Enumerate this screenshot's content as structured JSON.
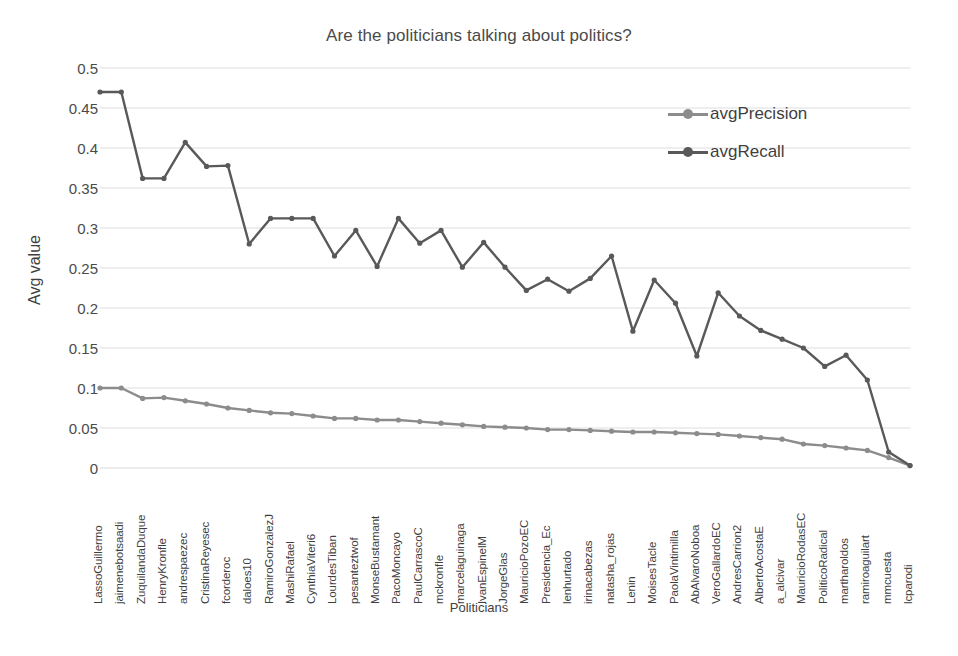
{
  "chart_data": {
    "type": "line",
    "title": "Are the politicians talking about politics?",
    "xlabel": "Politicians",
    "ylabel": "Avg value",
    "ylim": [
      0,
      0.5
    ],
    "yticks": [
      "0",
      "0.05",
      "0.1",
      "0.15",
      "0.2",
      "0.25",
      "0.3",
      "0.35",
      "0.4",
      "0.45",
      "0.5"
    ],
    "grid": true,
    "legend_position": "top-right",
    "categories": [
      "LassoGuillermo",
      "jaimenebotsaadi",
      "ZuquilandaDuque",
      "HenryKronfle",
      "andrespaezec",
      "CristinaReyesec",
      "fcorderoc",
      "daloes10",
      "RamiroGonzalezJ",
      "MashiRafael",
      "CynthiaViteri6",
      "LourdesTiban",
      "pesanteztwof",
      "MonseBustamant",
      "PacoMoncayo",
      "PaulCarrascoC",
      "mckronfle",
      "marcelaguinaga",
      "IvanEspinelM",
      "JorgeGlas",
      "MauricioPozoEC",
      "Presidencia_Ec",
      "lenhurtado",
      "irinacabezas",
      "natasha_rojas",
      "Lenin",
      "MoisesTacle",
      "PaolaVintimilla",
      "AbAlvaroNoboa",
      "VeroGallardoEC",
      "AndresCarrion2",
      "AlbertoAcostaE",
      "a_alcivar",
      "MauricioRodasEC",
      "PoliticoRadical",
      "martharoldos",
      "ramiroaguilart",
      "mmcuesta",
      "lcparodi"
    ],
    "series": [
      {
        "name": "avgPrecision",
        "color": "#8c8c8c",
        "values": [
          0.1,
          0.1,
          0.087,
          0.088,
          0.084,
          0.08,
          0.075,
          0.072,
          0.069,
          0.068,
          0.065,
          0.062,
          0.062,
          0.06,
          0.06,
          0.058,
          0.056,
          0.054,
          0.052,
          0.051,
          0.05,
          0.048,
          0.048,
          0.047,
          0.046,
          0.045,
          0.045,
          0.044,
          0.043,
          0.042,
          0.04,
          0.038,
          0.036,
          0.03,
          0.028,
          0.025,
          0.022,
          0.013,
          0.003
        ]
      },
      {
        "name": "avgRecall",
        "color": "#595959",
        "values": [
          0.47,
          0.47,
          0.362,
          0.362,
          0.407,
          0.377,
          0.378,
          0.28,
          0.312,
          0.312,
          0.312,
          0.265,
          0.297,
          0.252,
          0.312,
          0.281,
          0.297,
          0.251,
          0.282,
          0.251,
          0.222,
          0.236,
          0.221,
          0.237,
          0.265,
          0.171,
          0.235,
          0.206,
          0.14,
          0.219,
          0.19,
          0.172,
          0.161,
          0.15,
          0.127,
          0.141,
          0.11,
          0.02,
          0.003
        ]
      }
    ]
  },
  "legend": {
    "items": [
      {
        "label": "avgPrecision"
      },
      {
        "label": "avgRecall"
      }
    ]
  },
  "colors": {
    "precision": "#8c8c8c",
    "recall": "#595959",
    "grid": "#d9d9d9",
    "text": "#3f3f3f"
  }
}
